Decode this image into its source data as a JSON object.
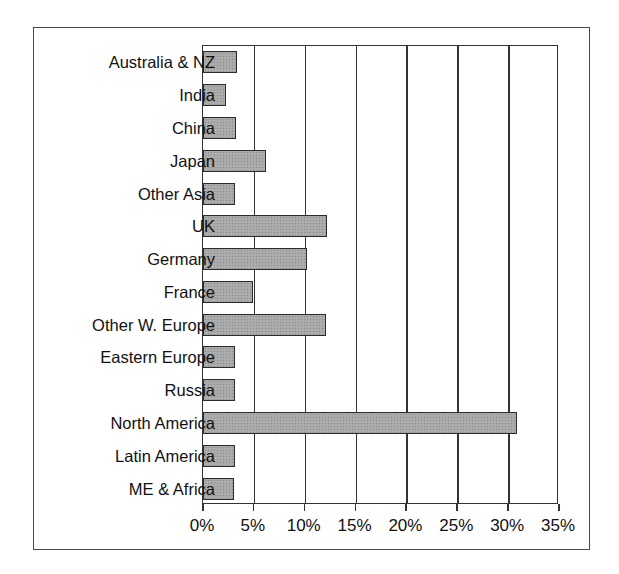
{
  "chart_data": {
    "type": "bar",
    "orientation": "horizontal",
    "title": "",
    "xlabel": "",
    "ylabel": "",
    "xlim": [
      0,
      35
    ],
    "xtick_labels": [
      "0%",
      "5%",
      "10%",
      "15%",
      "20%",
      "25%",
      "30%",
      "35%"
    ],
    "xticks": [
      0,
      5,
      10,
      15,
      20,
      25,
      30,
      35
    ],
    "grid": true,
    "legend": "none",
    "units": "percent",
    "categories": [
      "Australia & NZ",
      "India",
      "China",
      "Japan",
      "Other Asia",
      "UK",
      "Germany",
      "France",
      "Other W. Europe",
      "Eastern Europe",
      "Russia",
      "North America",
      "Latin America",
      "ME & Africa"
    ],
    "values": [
      3.3,
      2.3,
      3.2,
      6.2,
      3.1,
      12.2,
      10.2,
      4.9,
      12.1,
      3.1,
      3.1,
      30.9,
      3.1,
      3.0
    ],
    "bar_color": "#a8a8a8",
    "bar_edge_color": "#2b2b2b",
    "axis_color": "#333333",
    "frame_color": "#4a4a4a",
    "background_color": "#ffffff"
  }
}
